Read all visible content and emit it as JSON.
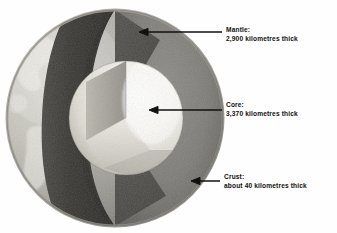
{
  "figure": {
    "background_color": "#ffffff",
    "text_color": "#111111"
  },
  "labels": [
    {
      "id": "mantle",
      "name": "Mantle:",
      "detail": "2,900 kilometres thick",
      "arrow_direction": "left"
    },
    {
      "id": "core",
      "name": "Core:",
      "detail": "3,370 kilometres thick",
      "arrow_direction": "left"
    },
    {
      "id": "crust",
      "name": "Crust:",
      "detail": "about 40 kilometres thick",
      "arrow_direction": "left"
    }
  ],
  "layers": {
    "crust_color": "#9a9a96",
    "mantle_outer_color": "#8a8a86",
    "mantle_cut_color": "#3c3c3a",
    "core_color": "#f2f0ea",
    "core_cut_color": "#c9c6bd"
  },
  "icons": {
    "arrow": "arrow-left-icon"
  }
}
